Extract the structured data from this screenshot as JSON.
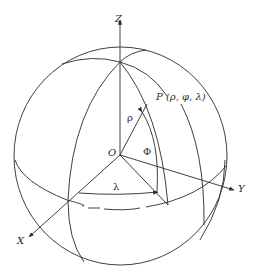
{
  "diagram": {
    "type": "spherical-coordinate-system",
    "axes": {
      "z_label": "Z",
      "x_label": "X",
      "y_label": "Y"
    },
    "origin_label": "O",
    "point_label": "P (ρ, φ, λ)",
    "radius_label": "ρ",
    "polar_angle_label": "Φ",
    "azimuth_label": "λ",
    "line_color": "#2a2a2a",
    "background": "#ffffff"
  }
}
